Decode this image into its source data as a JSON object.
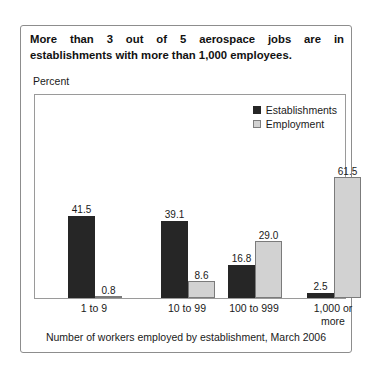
{
  "card": {
    "headline_line1": "More than 3 out of 5 aerospace jobs are in",
    "headline_line2": "establishments with more than 1,000 employees.",
    "axis_caption": "Percent",
    "footer_caption": "Number of workers employed by establishment, March 2006"
  },
  "colors": {
    "establishments": "#262626",
    "employment": "#d2d2d2",
    "employment_border": "#7b7b7b",
    "frame": "#9a9a9a",
    "card_border": "#8d8d8d",
    "text": "#1a1a1a"
  },
  "chart_data": {
    "type": "bar",
    "title": "More than 3 out of 5 aerospace jobs are in establishments with more than 1,000 employees.",
    "subtitle": "",
    "xlabel": "Number of workers employed by establishment, March 2006",
    "ylabel": "Percent",
    "ylim": [
      0,
      65
    ],
    "grid": false,
    "legend_position": "top-right",
    "categories": [
      "1 to 9",
      "10 to 99",
      "100 to 999",
      "1,000 or more"
    ],
    "series": [
      {
        "name": "Establishments",
        "color": "#262626",
        "values": [
          41.5,
          39.1,
          16.8,
          2.5
        ],
        "labels": [
          "41.5",
          "39.1",
          "16.8",
          "2.5"
        ]
      },
      {
        "name": "Employment",
        "color": "#d2d2d2",
        "values": [
          0.8,
          8.6,
          29.0,
          61.5
        ],
        "labels": [
          "0.8",
          "8.6",
          "29.0",
          "61.5"
        ]
      }
    ]
  },
  "legend": [
    {
      "label": "Establishments",
      "swatch": "dark"
    },
    {
      "label": "Employment",
      "swatch": "light"
    }
  ],
  "xaxis": [
    {
      "line1": "1 to 9",
      "line2": ""
    },
    {
      "line1": "10 to 99",
      "line2": ""
    },
    {
      "line1": "100 to 999",
      "line2": ""
    },
    {
      "line1": "1,000 or",
      "line2": "more"
    }
  ]
}
